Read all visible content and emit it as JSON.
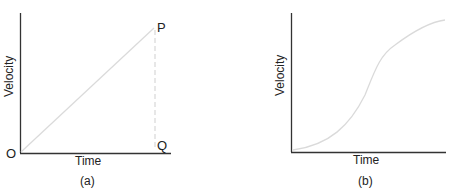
{
  "figure_a": {
    "caption": "(a)",
    "xlabel": "Time",
    "ylabel": "Velocity",
    "origin_label": "O",
    "point_p_label": "P",
    "point_q_label": "Q",
    "description": "Straight line from O to P (uniform acceleration); dashed vertical from P to Q"
  },
  "figure_b": {
    "caption": "(b)",
    "xlabel": "Time",
    "ylabel": "Velocity",
    "description": "S-shaped curve (non-uniform acceleration)"
  },
  "colors": {
    "axis": "#333333",
    "curve": "#d8d8d8",
    "dashed": "#cccccc"
  }
}
